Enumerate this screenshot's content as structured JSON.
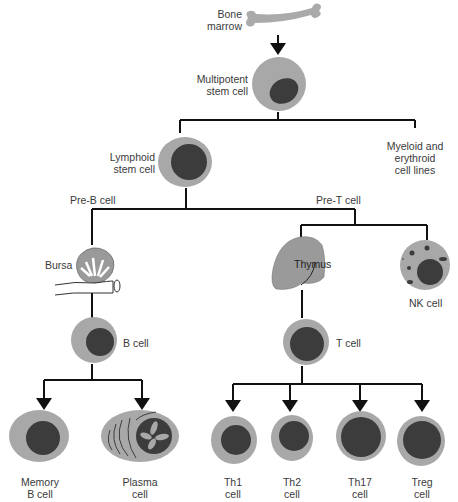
{
  "diagram": {
    "colors": {
      "cytoplasm": "#a8a8a8",
      "nucleus": "#3c3c3c",
      "organ": "#9a9a9a",
      "line": "#111111",
      "text": "#3a3a3a"
    },
    "labels": {
      "bone_marrow": [
        "Bone",
        "marrow"
      ],
      "multipotent": [
        "Multipotent",
        "stem cell"
      ],
      "lymphoid": [
        "Lymphoid",
        "stem cell"
      ],
      "myeloid": [
        "Myeloid and",
        "erythroid",
        "cell lines"
      ],
      "pre_b": "Pre-B cell",
      "pre_t": "Pre-T cell",
      "bursa": "Bursa",
      "thymus": "Thymus",
      "nk": "NK cell",
      "b_cell": "B cell",
      "t_cell": "T cell",
      "memory_b": [
        "Memory",
        "B cell"
      ],
      "plasma": [
        "Plasma",
        "cell"
      ],
      "th1": [
        "Th1",
        "cell"
      ],
      "th2": [
        "Th2",
        "cell"
      ],
      "th17": [
        "Th17",
        "cell"
      ],
      "treg": [
        "Treg",
        "cell"
      ]
    }
  }
}
